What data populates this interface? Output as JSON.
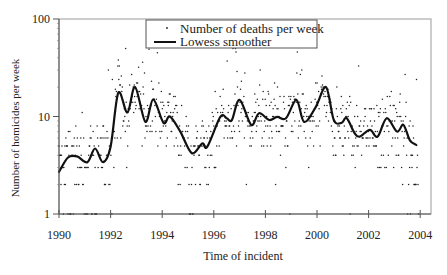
{
  "chart_data": {
    "type": "scatter",
    "title": "",
    "xlabel": "Time of incident",
    "ylabel": "Number of homicides per week",
    "yscale": "log",
    "xlim": [
      1990,
      2004.4
    ],
    "ylim": [
      1,
      100
    ],
    "x_ticks": [
      1990,
      1992,
      1994,
      1996,
      1998,
      2000,
      2002,
      2004
    ],
    "y_ticks": [
      1,
      10,
      100
    ],
    "grid": false,
    "legend": {
      "position": "top-center (inside plot)",
      "entries": [
        {
          "label": "Number of deaths per week",
          "marker": "dot"
        },
        {
          "label": "Lowess smoother",
          "marker": "line"
        }
      ]
    },
    "series": [
      {
        "name": "Lowess smoother",
        "kind": "line",
        "x": [
          1990.0,
          1990.35,
          1990.7,
          1991.1,
          1991.4,
          1991.7,
          1992.0,
          1992.3,
          1992.65,
          1992.95,
          1993.35,
          1993.65,
          1994.05,
          1994.3,
          1994.7,
          1995.15,
          1995.55,
          1995.75,
          1996.25,
          1996.5,
          1996.7,
          1997.0,
          1997.45,
          1997.75,
          1998.15,
          1998.45,
          1998.8,
          1999.2,
          1999.5,
          1999.95,
          2000.35,
          2000.65,
          2000.95,
          2001.15,
          2001.45,
          2001.65,
          2002.05,
          2002.35,
          2002.7,
          2003.1,
          2003.35,
          2003.6,
          2003.85
        ],
        "values": [
          2.7,
          3.8,
          3.9,
          3.4,
          4.7,
          3.4,
          4.9,
          17.5,
          11,
          20,
          8.8,
          15,
          8.6,
          10,
          7,
          4.2,
          5.3,
          4.9,
          9.9,
          9.6,
          9.2,
          14.8,
          8.2,
          10.8,
          9.2,
          9.9,
          9.6,
          14.8,
          8.8,
          12.5,
          20,
          9.2,
          8.6,
          9.6,
          6.8,
          6.2,
          7.3,
          6.2,
          9.6,
          7,
          8.2,
          5.7,
          5.1
        ]
      },
      {
        "name": "Number of deaths per week",
        "kind": "points",
        "note": "weekly counts 1990-2004; dense integer bands at 1-7, scattered values up to ~65",
        "levels_common": [
          1,
          2,
          3,
          4,
          5,
          6,
          7,
          8,
          9,
          10
        ],
        "max_observed": 65
      }
    ]
  },
  "style": {
    "axis_color": "#555555",
    "frame_color": "#999999",
    "point_color": "#222222",
    "line_color": "#111111"
  }
}
